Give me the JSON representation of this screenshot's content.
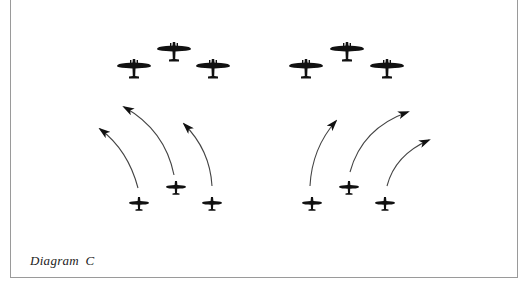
{
  "caption": "Diagram C",
  "colors": {
    "ink": "#111111",
    "arrow": "#444444",
    "frame": "#9a9a9a",
    "background": "#ffffff"
  },
  "groups": [
    {
      "name": "left",
      "bombers": [
        {
          "x": 134,
          "y": 66
        },
        {
          "x": 174,
          "y": 49
        },
        {
          "x": 213,
          "y": 66
        }
      ],
      "fighters": [
        {
          "x": 139,
          "y": 203
        },
        {
          "x": 176,
          "y": 187
        },
        {
          "x": 212,
          "y": 203
        }
      ],
      "arrows": [
        {
          "from": [
            138,
            188
          ],
          "ctrl": [
            128,
            150
          ],
          "to": [
            100,
            129
          ]
        },
        {
          "from": [
            174,
            175
          ],
          "ctrl": [
            165,
            130
          ],
          "to": [
            124,
            107
          ]
        },
        {
          "from": [
            212,
            186
          ],
          "ctrl": [
            210,
            150
          ],
          "to": [
            184,
            124
          ]
        }
      ]
    },
    {
      "name": "right",
      "bombers": [
        {
          "x": 306,
          "y": 66
        },
        {
          "x": 347,
          "y": 49
        },
        {
          "x": 387,
          "y": 66
        }
      ],
      "fighters": [
        {
          "x": 312,
          "y": 203
        },
        {
          "x": 349,
          "y": 187
        },
        {
          "x": 385,
          "y": 203
        }
      ],
      "arrows": [
        {
          "from": [
            310,
            186
          ],
          "ctrl": [
            312,
            148
          ],
          "to": [
            336,
            121
          ]
        },
        {
          "from": [
            350,
            172
          ],
          "ctrl": [
            362,
            128
          ],
          "to": [
            408,
            112
          ]
        },
        {
          "from": [
            387,
            186
          ],
          "ctrl": [
            395,
            155
          ],
          "to": [
            429,
            140
          ]
        }
      ]
    }
  ]
}
